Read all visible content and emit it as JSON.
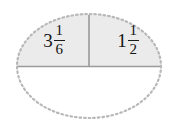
{
  "figure": {
    "kind": "ellipse-fraction-diagram",
    "background_color": "#ffffff",
    "ellipse": {
      "center_x": 89,
      "center_y": 66,
      "radius_x": 72,
      "radius_y": 52,
      "border_style": "dotted",
      "border_color": "#b8b8b8",
      "border_width": 2
    },
    "upper_half": {
      "fill_color": "#ebebeb",
      "divider_color": "#9a9a9a",
      "horizontal_divider_y": 66,
      "vertical_divider_x": 89
    },
    "lower_half": {
      "fill_color": "#ffffff",
      "label": ""
    },
    "cells": [
      {
        "name": "left-cell",
        "value": "3 1/6",
        "whole": "3",
        "numerator": "1",
        "denominator": "6"
      },
      {
        "name": "right-cell",
        "value": "1 1/2",
        "whole": "1",
        "numerator": "1",
        "denominator": "2"
      }
    ]
  }
}
